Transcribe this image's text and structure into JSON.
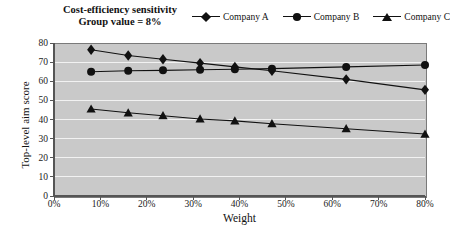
{
  "chart_data": {
    "type": "line",
    "title": "Cost-efficiency sensitivity",
    "subtitle": "Group value = 8%",
    "xlabel": "Weight",
    "ylabel": "Top-level aim score",
    "xlim": [
      0,
      80
    ],
    "ylim": [
      0,
      80
    ],
    "xtick_labels": [
      "0%",
      "10%",
      "20%",
      "30%",
      "40%",
      "50%",
      "60%",
      "70%",
      "80%"
    ],
    "xticks": [
      0,
      10,
      20,
      30,
      40,
      50,
      60,
      70,
      80
    ],
    "ytick_labels": [
      "0",
      "10",
      "20",
      "30",
      "40",
      "50",
      "60",
      "70",
      "80"
    ],
    "yticks": [
      0,
      10,
      20,
      30,
      40,
      50,
      60,
      70,
      80
    ],
    "grid": "horizontal",
    "legend_position": "top-right",
    "x": [
      8,
      16,
      23.5,
      31.5,
      39,
      47,
      63,
      80
    ],
    "series": [
      {
        "name": "Company A",
        "marker": "diamond",
        "values": [
          76.5,
          73.5,
          71.5,
          69.5,
          67.5,
          65.5,
          61.0,
          55.5
        ]
      },
      {
        "name": "Company B",
        "marker": "circle",
        "values": [
          65.0,
          65.5,
          65.7,
          66.0,
          66.3,
          66.6,
          67.5,
          68.5
        ]
      },
      {
        "name": "Company C",
        "marker": "triangle",
        "values": [
          45.5,
          43.5,
          42.0,
          40.3,
          39.3,
          37.8,
          35.2,
          32.4
        ]
      }
    ]
  },
  "colors": {
    "plot_background": "#c9c9c9",
    "grid": "#f2f2f2",
    "series": "#111111",
    "axis": "#555555",
    "page_background": "#ffffff"
  }
}
